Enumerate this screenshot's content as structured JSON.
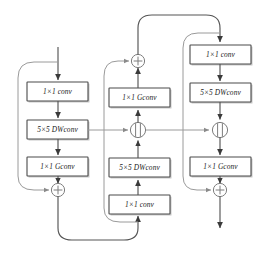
{
  "diagram": {
    "colors": {
      "box_stroke": "#4a4a4a",
      "box_fill": "#ffffff",
      "flow_line": "#555555",
      "skip_line": "#9a9a9a",
      "node_stroke": "#7d7d7d",
      "text": "#1a1a1a",
      "background": "#ffffff"
    },
    "labels": {
      "conv1x1": "1×1 conv",
      "dwconv5x5": "5×5 DWconv",
      "gconv1x1": "1×1 Gconv",
      "add_node": "+",
      "concat_node": "||"
    },
    "branches": [
      {
        "name": "left-branch",
        "flow": "top-down",
        "boxes": [
          {
            "id": "left-box-1",
            "label": "1×1 conv"
          },
          {
            "id": "left-box-2",
            "label": "5×5 DWconv"
          },
          {
            "id": "left-box-3",
            "label": "1×1 Gconv"
          }
        ],
        "nodes": [
          {
            "id": "left-add",
            "type": "add",
            "glyph": "+"
          }
        ],
        "has_skip_connection": true
      },
      {
        "name": "middle-branch",
        "flow": "bottom-up",
        "boxes": [
          {
            "id": "mid-box-1",
            "label": "1×1 conv"
          },
          {
            "id": "mid-box-2",
            "label": "5×5 DWconv"
          },
          {
            "id": "mid-box-3",
            "label": "1×1 Gconv"
          }
        ],
        "nodes": [
          {
            "id": "mid-concat",
            "type": "concat",
            "glyph": "||"
          },
          {
            "id": "mid-add",
            "type": "add",
            "glyph": "+"
          }
        ],
        "has_skip_connection": true
      },
      {
        "name": "right-branch",
        "flow": "top-down",
        "boxes": [
          {
            "id": "right-box-1",
            "label": "1×1 conv"
          },
          {
            "id": "right-box-2",
            "label": "5×5 DWconv"
          },
          {
            "id": "right-box-3",
            "label": "1×1 Gconv"
          }
        ],
        "nodes": [
          {
            "id": "right-concat",
            "type": "concat",
            "glyph": "||"
          },
          {
            "id": "right-add",
            "type": "add",
            "glyph": "+"
          }
        ],
        "has_skip_connection": true
      }
    ],
    "cross_connections": [
      {
        "from": "left-box-2",
        "to": "mid-concat",
        "direction": "horizontal-right"
      },
      {
        "from": "mid-concat",
        "to": "right-concat",
        "direction": "horizontal-right"
      },
      {
        "from": "left-add",
        "to": "mid-box-1",
        "direction": "bottom-route"
      },
      {
        "from": "mid-add",
        "to": "right-box-1",
        "direction": "top-route"
      }
    ]
  }
}
